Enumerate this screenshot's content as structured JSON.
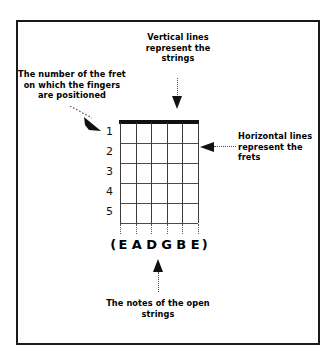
{
  "diagram": {
    "title_alt": "Guitar chord diagram legend",
    "frame_color": "#1a1a1a",
    "ink_color": "#000000"
  },
  "captions": {
    "vertical_strings": "Vertical lines represent the strings",
    "fret_number": "The number of the fret on which the fingers are positioned",
    "horizontal_frets": "Horizontal lines represent the frets",
    "open_notes": "The notes of the open strings"
  },
  "fretboard": {
    "fret_numbers": [
      "1",
      "2",
      "3",
      "4",
      "5"
    ],
    "string_count": 6,
    "fret_count": 5,
    "nut_color": "#111111",
    "line_color": "#3c3c3c"
  },
  "open_strings": {
    "open_paren": "(",
    "close_paren": ")",
    "notes": [
      "E",
      "A",
      "D",
      "G",
      "B",
      "E"
    ],
    "full_label": "(E A D G B E)"
  },
  "arrows": {
    "vertical_strings": "arrow-down",
    "fret_number": "arrow-diagonal-down-right",
    "horizontal_frets": "arrow-left",
    "open_notes": "arrow-up"
  }
}
